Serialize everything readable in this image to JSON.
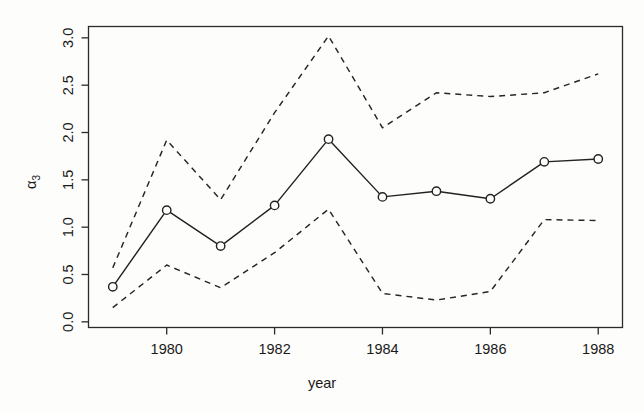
{
  "chart_data": {
    "type": "line",
    "title": "",
    "subtitle": "",
    "xlabel": "year",
    "ylabel": "α₃",
    "ylabel_base": "α",
    "ylabel_sub": "3",
    "x": [
      1979,
      1980,
      1981,
      1982,
      1983,
      1984,
      1985,
      1986,
      1987,
      1988
    ],
    "xlim": [
      1978.55,
      1988.45
    ],
    "ylim": [
      -0.06,
      3.12
    ],
    "xticks": [
      1980,
      1982,
      1984,
      1986,
      1988
    ],
    "xticklabels": [
      "1980",
      "1982",
      "1984",
      "1986",
      "1988"
    ],
    "yticks": [
      0.0,
      0.5,
      1.0,
      1.5,
      2.0,
      2.5,
      3.0
    ],
    "yticklabels": [
      "0.0",
      "0.5",
      "1.0",
      "1.5",
      "2.0",
      "2.5",
      "3.0"
    ],
    "grid": false,
    "legend": "none",
    "series": [
      {
        "name": "estimate",
        "style": "solid",
        "marker": "open-circle",
        "values": [
          0.37,
          1.18,
          0.8,
          1.23,
          1.93,
          1.32,
          1.38,
          1.3,
          1.69,
          1.72
        ]
      },
      {
        "name": "upper confidence band",
        "style": "dashed",
        "marker": "none",
        "values": [
          0.57,
          1.92,
          1.29,
          2.21,
          3.02,
          2.05,
          2.42,
          2.38,
          2.42,
          2.62
        ]
      },
      {
        "name": "lower confidence band",
        "style": "dashed",
        "marker": "none",
        "values": [
          0.15,
          0.6,
          0.36,
          0.73,
          1.19,
          0.3,
          0.23,
          0.32,
          1.08,
          1.07
        ]
      }
    ],
    "colors": {
      "line": "#222222",
      "axis": "#2b2b2b",
      "background": "#fdfdfb"
    }
  }
}
